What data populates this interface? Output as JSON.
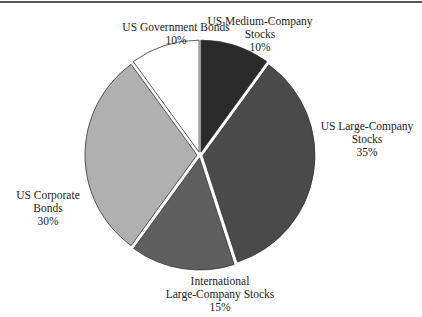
{
  "chart_data": {
    "type": "pie",
    "title": "",
    "slices": [
      {
        "label": "US Medium-Company Stocks",
        "value": 10,
        "color": "#2a2a2a"
      },
      {
        "label": "US Large-Company Stocks",
        "value": 35,
        "color": "#4a4a4a"
      },
      {
        "label": "International Large-Company Stocks",
        "value": 15,
        "color": "#5e5e5e"
      },
      {
        "label": "US Corporate Bonds",
        "value": 30,
        "color": "#b0b0b0"
      },
      {
        "label": "US Government Bonds",
        "value": 10,
        "color": "#ffffff"
      }
    ]
  },
  "labels": {
    "medium": {
      "l1": "US Medium-Company",
      "l2": "Stocks",
      "pct": "10%"
    },
    "large": {
      "l1": "US Large-Company",
      "l2": "Stocks",
      "pct": "35%"
    },
    "intl": {
      "l1": "International",
      "l2": "Large-Company Stocks",
      "pct": "15%"
    },
    "corp": {
      "l1": "US Corporate",
      "l2": "Bonds",
      "pct": "30%"
    },
    "gov": {
      "l1": "US Government Bonds",
      "pct": "10%"
    }
  }
}
